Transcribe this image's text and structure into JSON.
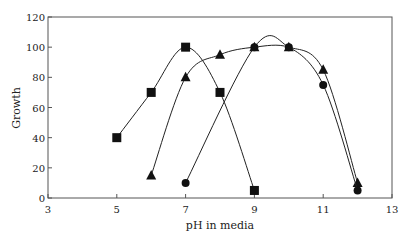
{
  "chart_data": {
    "type": "line",
    "title": "",
    "xlabel": "pH in media",
    "ylabel": "Growth",
    "xlim": [
      3,
      13
    ],
    "ylim": [
      0,
      120
    ],
    "xticks": [
      3,
      5,
      7,
      9,
      11,
      13
    ],
    "yticks": [
      0,
      20,
      40,
      60,
      80,
      100,
      120
    ],
    "grid": false,
    "legend": null,
    "series": [
      {
        "name": "square",
        "marker": "square",
        "x": [
          5,
          6,
          7,
          8,
          9
        ],
        "y": [
          40,
          70,
          100,
          70,
          5
        ]
      },
      {
        "name": "triangle",
        "marker": "triangle",
        "x": [
          6,
          7,
          8,
          9,
          10,
          11,
          12
        ],
        "y": [
          15,
          80,
          95,
          100,
          100,
          85,
          10
        ]
      },
      {
        "name": "circle",
        "marker": "circle",
        "x": [
          7,
          9,
          10,
          11,
          12
        ],
        "y": [
          10,
          100,
          100,
          75,
          5
        ]
      }
    ]
  },
  "colors": {
    "line": "#222222",
    "marker": "#111111",
    "axis": "#444444"
  }
}
